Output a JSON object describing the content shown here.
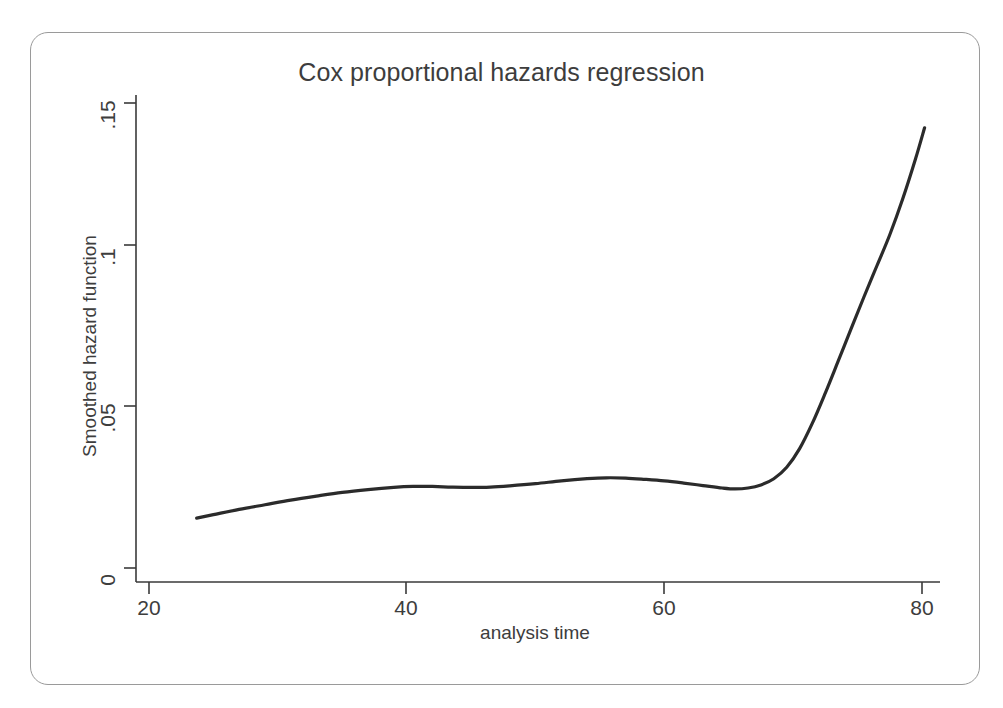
{
  "chart_data": {
    "type": "line",
    "title": "Cox proportional hazards regression",
    "xlabel": "analysis time",
    "ylabel": "Smoothed hazard function",
    "xlim": [
      20,
      80.5
    ],
    "ylim": [
      0,
      0.155
    ],
    "xticks": [
      20,
      40,
      60,
      80
    ],
    "xtick_labels": [
      "20",
      "40",
      "60",
      "80"
    ],
    "yticks": [
      0,
      0.05,
      0.1,
      0.15
    ],
    "ytick_labels": [
      "0",
      ".05",
      ".1",
      ".15"
    ],
    "grid": false,
    "legend": null,
    "series": [
      {
        "name": "Smoothed hazard function",
        "color": "#2b2b2b",
        "line_width": 3.2,
        "x": [
          23.7,
          25.0,
          27.0,
          29.0,
          31.0,
          33.0,
          35.0,
          37.0,
          39.0,
          40.5,
          42.0,
          43.5,
          45.0,
          46.5,
          48.0,
          50.0,
          52.0,
          54.0,
          55.5,
          57.0,
          58.5,
          60.0,
          61.5,
          63.0,
          64.5,
          65.5,
          66.5,
          67.5,
          68.5,
          69.5,
          70.5,
          71.5,
          72.5,
          73.5,
          74.5,
          75.5,
          76.5,
          77.5,
          78.5,
          79.5,
          80.2
        ],
        "y": [
          0.0161,
          0.0172,
          0.0189,
          0.0204,
          0.0219,
          0.0232,
          0.0244,
          0.0253,
          0.026,
          0.0263,
          0.0263,
          0.0261,
          0.026,
          0.0261,
          0.0265,
          0.0272,
          0.0281,
          0.0288,
          0.0291,
          0.029,
          0.0286,
          0.0281,
          0.0274,
          0.0266,
          0.0258,
          0.0255,
          0.0258,
          0.0268,
          0.0288,
          0.0325,
          0.0385,
          0.0468,
          0.0565,
          0.0668,
          0.0772,
          0.0875,
          0.0975,
          0.1075,
          0.119,
          0.132,
          0.142
        ]
      }
    ]
  },
  "axes": {
    "x_tick_pixels": [
      149,
      406,
      664,
      922
    ],
    "y_tick_pixels": [
      568,
      406,
      245,
      103
    ],
    "axis_color": "#3a3a3a",
    "frame_color": "#9a9a9a",
    "background": "#ffffff"
  }
}
